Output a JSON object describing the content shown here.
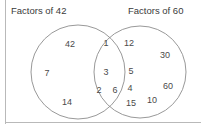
{
  "diagram": {
    "type": "venn",
    "title_left": "Factors of 42",
    "title_right": "Factors of 60",
    "stroke_color": "#8d8d8d",
    "text_color": "#4a4a4a",
    "frame_color": "#b9b9b9",
    "background": "#ffffff",
    "sets": {
      "left_only": {
        "label": "Factors of 42",
        "values": [
          "42",
          "7",
          "14"
        ]
      },
      "intersection": {
        "label": "Common factors of 42 and 60",
        "values": [
          "1",
          "3",
          "2",
          "6"
        ]
      },
      "right_only": {
        "label": "Factors of 60",
        "values": [
          "12",
          "30",
          "5",
          "4",
          "60",
          "15",
          "10"
        ]
      }
    },
    "labels": [
      {
        "name": "left-only-42",
        "text": "42",
        "x": 70,
        "y": 44
      },
      {
        "name": "left-only-7",
        "text": "7",
        "x": 47,
        "y": 73
      },
      {
        "name": "left-only-14",
        "text": "14",
        "x": 67,
        "y": 102
      },
      {
        "name": "intersection-1",
        "text": "1",
        "x": 106,
        "y": 43
      },
      {
        "name": "intersection-3",
        "text": "3",
        "x": 106,
        "y": 72
      },
      {
        "name": "intersection-2",
        "text": "2",
        "x": 99,
        "y": 90
      },
      {
        "name": "intersection-6",
        "text": "6",
        "x": 115,
        "y": 90
      },
      {
        "name": "right-only-12",
        "text": "12",
        "x": 129,
        "y": 43
      },
      {
        "name": "right-only-30",
        "text": "30",
        "x": 165,
        "y": 55
      },
      {
        "name": "right-only-5",
        "text": "5",
        "x": 131,
        "y": 71
      },
      {
        "name": "right-only-4",
        "text": "4",
        "x": 130,
        "y": 88
      },
      {
        "name": "right-only-60",
        "text": "60",
        "x": 168,
        "y": 86
      },
      {
        "name": "right-only-15",
        "text": "15",
        "x": 131,
        "y": 103
      },
      {
        "name": "right-only-10",
        "text": "10",
        "x": 152,
        "y": 100
      }
    ],
    "circles": [
      {
        "name": "left-circle",
        "cx": 78,
        "cy": 72,
        "r": 47
      },
      {
        "name": "right-circle",
        "cx": 140,
        "cy": 72,
        "r": 46
      }
    ]
  }
}
